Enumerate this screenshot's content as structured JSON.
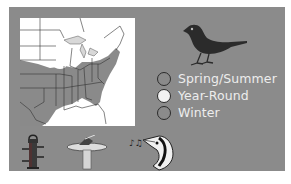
{
  "colors": {
    "panel_bg": "#8b8b8b",
    "map_land_unshaded": "#ffffff",
    "map_range_shaded": "#8a8a8a",
    "legend_text": "#ededed",
    "bird_silhouette": "#2b2b2b"
  },
  "map": {
    "icon": "range-map-eastern-us",
    "region": "Eastern United States"
  },
  "bird": {
    "icon": "songbird-silhouette-icon"
  },
  "legend": {
    "items": [
      {
        "label": "Spring/Summer",
        "swatch_color": "#8a8a8a"
      },
      {
        "label": "Year-Round",
        "swatch_color": "#f2f2f2"
      },
      {
        "label": "Winter",
        "swatch_color": "#8b8b8b"
      }
    ]
  },
  "feeding_icons": [
    {
      "name": "tube-feeder-icon"
    },
    {
      "name": "birdbath-icon"
    },
    {
      "name": "song-bird-head-icon"
    }
  ]
}
